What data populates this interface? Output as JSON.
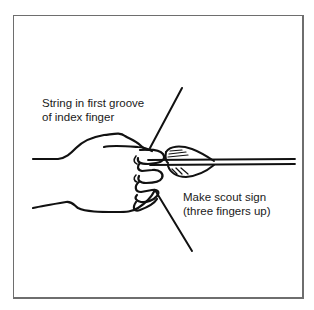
{
  "figure": {
    "type": "instructional-illustration",
    "annotations": [
      {
        "id": "string-position",
        "lines": [
          "String in first groove",
          "of index finger"
        ]
      },
      {
        "id": "finger-position",
        "lines": [
          "Make scout sign",
          "(three fingers up)"
        ]
      }
    ],
    "colors": {
      "ink": "#111111",
      "frame": "#6e6e6e",
      "background": "#ffffff"
    }
  }
}
